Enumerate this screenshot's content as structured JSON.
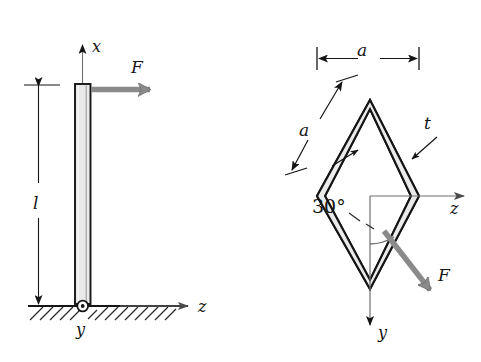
{
  "figure": {
    "background_color": "#ffffff",
    "ink_color": "#151515",
    "force_arrow_color": "#8a8a8a",
    "axis_color": "#6f6f6f",
    "beam_fill_color": "#e9e9e9",
    "wall_fill_color": "#ebebeb",
    "panels": [
      {
        "name": "side-elevation",
        "labels": {
          "x_axis": "x",
          "z_axis": "z",
          "y_axis": "y",
          "force": "F",
          "length": "l"
        },
        "elements": [
          "vertical-cantilever-beam",
          "ground-hatching",
          "pin-origin-marker",
          "length-dimension-arrow",
          "force-arrow-horizontal"
        ]
      },
      {
        "name": "cross-section",
        "labels": {
          "width_dimension": "a",
          "side_dimension": "a",
          "thickness": "t",
          "angle": "30°",
          "z_axis": "z",
          "y_axis": "y",
          "force": "F"
        },
        "elements": [
          "rhombus-thin-wall-section",
          "width-dimension-arrow",
          "side-dimension-arrow",
          "thickness-leader-arrows",
          "angle-arc",
          "force-arrow-diagonal"
        ]
      }
    ]
  }
}
